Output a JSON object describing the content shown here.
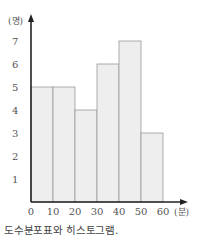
{
  "chart_data": {
    "type": "bar",
    "subtype": "histogram",
    "title": "",
    "xlabel": "(분)",
    "ylabel": "(명)",
    "bins": [
      [
        0,
        10
      ],
      [
        10,
        20
      ],
      [
        20,
        30
      ],
      [
        30,
        40
      ],
      [
        40,
        50
      ],
      [
        50,
        60
      ]
    ],
    "categories": [
      "0-10",
      "10-20",
      "20-30",
      "30-40",
      "40-50",
      "50-60"
    ],
    "values": [
      5,
      5,
      4,
      6,
      7,
      3
    ],
    "x_ticks": [
      "0",
      "10",
      "20",
      "30",
      "40",
      "50",
      "60"
    ],
    "y_ticks": [
      "1",
      "2",
      "3",
      "4",
      "5",
      "6",
      "7"
    ],
    "ylim": [
      0,
      8
    ],
    "xlim": [
      0,
      60
    ],
    "grid": false,
    "legend": null,
    "bar_fill": "#eeeeee",
    "bar_stroke": "#999999"
  },
  "caption": "도수분포표와 히스토그램."
}
